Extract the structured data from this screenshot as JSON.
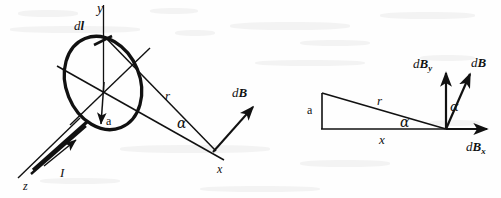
{
  "figure": {
    "ink_color": "#111111",
    "background_color": "#fefefe",
    "panels": [
      {
        "id": "left",
        "name": "current-loop-3d-view"
      },
      {
        "id": "right",
        "name": "field-component-triangle-view"
      }
    ]
  },
  "left_panel": {
    "labels": {
      "axis_y": "y",
      "axis_z": "z",
      "axis_x": "x",
      "current_element": "d",
      "current_element_vector": "l",
      "current": "I",
      "radius": "a",
      "distance": "r",
      "angle": "α",
      "field_d": "d",
      "field_vector": "B"
    }
  },
  "right_panel": {
    "labels": {
      "radius": "a",
      "distance": "r",
      "axial_distance": "x",
      "angle_base": "α",
      "angle_vector": "α",
      "field_y_d": "d",
      "field_y_vector": "B",
      "field_y_sub": "y",
      "field_d": "d",
      "field_vector": "B",
      "field_x_d": "d",
      "field_x_vector": "B",
      "field_x_sub": "x"
    }
  }
}
